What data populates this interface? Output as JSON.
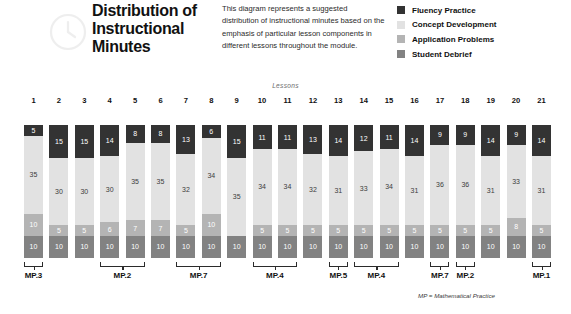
{
  "header": {
    "title": "Distribution of Instructional Minutes",
    "description": "This diagram represents a suggested distribution of instructional minutes based on the emphasis of particular lesson components in different lessons throughout the module.",
    "watermark_icon": "clock-icon"
  },
  "legend": {
    "position": "top-right",
    "items": [
      {
        "label": "Fluency Practice",
        "color": "#333333"
      },
      {
        "label": "Concept Development",
        "color": "#e2e2e2"
      },
      {
        "label": "Application Problems",
        "color": "#b4b4b4"
      },
      {
        "label": "Student Debrief",
        "color": "#828282"
      }
    ]
  },
  "axis_title": "Lessons",
  "footnote": "MP = Mathematical Practice",
  "brackets": [
    {
      "label": "MP.3",
      "start_lesson": 1,
      "end_lesson": 1
    },
    {
      "label": "MP.2",
      "start_lesson": 4,
      "end_lesson": 5
    },
    {
      "label": "MP.7",
      "start_lesson": 7,
      "end_lesson": 8
    },
    {
      "label": "MP.4",
      "start_lesson": 10,
      "end_lesson": 11
    },
    {
      "label": "MP.5",
      "start_lesson": 13,
      "end_lesson": 13
    },
    {
      "label": "MP.4",
      "start_lesson": 14,
      "end_lesson": 15
    },
    {
      "label": "MP.7",
      "start_lesson": 17,
      "end_lesson": 17
    },
    {
      "label": "MP.2",
      "start_lesson": 18,
      "end_lesson": 18
    },
    {
      "label": "MP.1",
      "start_lesson": 21,
      "end_lesson": 21
    }
  ],
  "chart_data": {
    "type": "bar",
    "stacked": true,
    "title": "Distribution of Instructional Minutes",
    "xlabel": "Lessons",
    "ylabel": "",
    "ylim": [
      0,
      60
    ],
    "grid": false,
    "legend_position": "top-right",
    "categories": [
      "1",
      "2",
      "3",
      "4",
      "5",
      "6",
      "7",
      "8",
      "9",
      "10",
      "11",
      "12",
      "13",
      "14",
      "15",
      "16",
      "17",
      "18",
      "19",
      "20",
      "21"
    ],
    "series": [
      {
        "name": "Fluency Practice",
        "color": "#333333",
        "values": [
          5,
          15,
          15,
          14,
          8,
          8,
          13,
          6,
          15,
          11,
          11,
          13,
          14,
          12,
          11,
          14,
          9,
          9,
          14,
          9,
          14
        ]
      },
      {
        "name": "Concept Development",
        "color": "#e2e2e2",
        "values": [
          35,
          30,
          30,
          30,
          35,
          35,
          32,
          34,
          35,
          34,
          34,
          32,
          31,
          33,
          34,
          31,
          36,
          36,
          31,
          33,
          31
        ]
      },
      {
        "name": "Application Problems",
        "color": "#b4b4b4",
        "values": [
          10,
          5,
          5,
          6,
          7,
          7,
          5,
          10,
          0,
          5,
          5,
          5,
          5,
          5,
          5,
          5,
          5,
          5,
          5,
          8,
          5
        ]
      },
      {
        "name": "Student Debrief",
        "color": "#828282",
        "values": [
          10,
          10,
          10,
          10,
          10,
          10,
          10,
          10,
          10,
          10,
          10,
          10,
          10,
          10,
          10,
          10,
          10,
          10,
          10,
          10,
          10
        ]
      }
    ]
  }
}
